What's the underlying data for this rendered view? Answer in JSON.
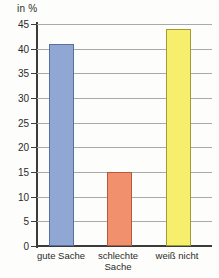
{
  "chart_data": {
    "type": "bar",
    "title": "",
    "subtitle": "",
    "unit_label": "in %",
    "xlabel": "",
    "ylabel": "in %",
    "categories": [
      "gute Sache",
      "schlechte\nSache",
      "weiß nicht"
    ],
    "values": [
      41,
      15,
      44
    ],
    "ylim": [
      0,
      45
    ],
    "ytick_values": [
      45,
      40,
      35,
      30,
      25,
      20,
      15,
      10,
      5,
      0
    ],
    "ytick_labels": [
      "45",
      "40",
      "35",
      "30",
      "25",
      "20",
      "15",
      "10",
      "5",
      "0"
    ],
    "grid": true,
    "legend": "none",
    "bar_colors": [
      "#8fa7d2",
      "#f0906c",
      "#f5ef6d"
    ],
    "bar_border_colors": [
      "#5a6f9e",
      "#b5593c",
      "#a39a34"
    ],
    "axis_color": "#3b3b3b",
    "gridline_color": "#a9a9a9",
    "background": "#fdfdfb",
    "series": [
      {
        "name": "Anteil",
        "points": [
          {
            "category": "gute Sache",
            "value": 41
          },
          {
            "category": "schlechte Sache",
            "value": 15
          },
          {
            "category": "weiß nicht",
            "value": 44
          }
        ]
      }
    ]
  }
}
